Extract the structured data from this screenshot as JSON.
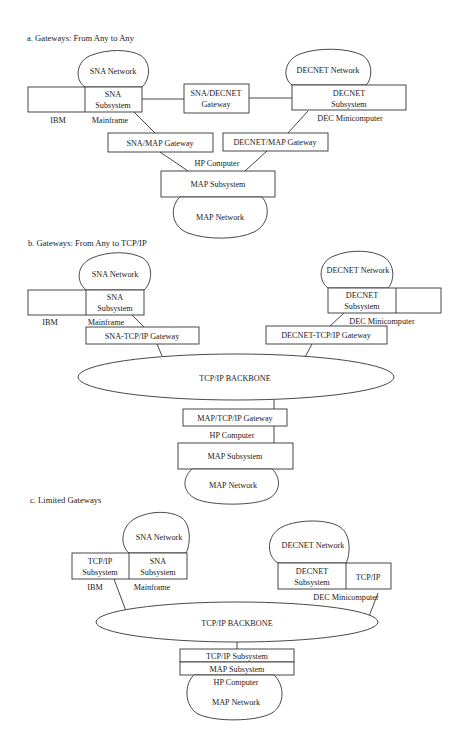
{
  "sections": {
    "a": {
      "title": "a. Gateways: From Any to Any",
      "sna_network": "SNA Network",
      "sna_subsystem_l1": "SNA",
      "sna_subsystem_l2": "Subsystem",
      "ibm": "IBM",
      "mainframe": "Mainframe",
      "sna_decnet_gateway_l1": "SNA/DECNET",
      "sna_decnet_gateway_l2": "Gateway",
      "decnet_network": "DECNET Network",
      "decnet_subsystem_l1": "DECNET",
      "decnet_subsystem_l2": "Subsystem",
      "dec_minicomputer": "DEC Minicomputer",
      "sna_map_gateway": "SNA/MAP Gateway",
      "decnet_map_gateway": "DECNET/MAP Gateway",
      "hp_computer": "HP Computer",
      "map_subsystem": "MAP Subsystem",
      "map_network": "MAP Network"
    },
    "b": {
      "title": "b. Gateways: From Any to TCP/IP",
      "sna_network": "SNA Network",
      "sna_subsystem_l1": "SNA",
      "sna_subsystem_l2": "Subsystem",
      "ibm": "IBM",
      "mainframe": "Mainframe",
      "decnet_network": "DECNET Network",
      "decnet_subsystem_l1": "DECNET",
      "decnet_subsystem_l2": "Subsystem",
      "dec_minicomputer": "DEC Minicomputer",
      "sna_tcpip_gateway": "SNA-TCP/IP Gateway",
      "decnet_tcpip_gateway": "DECNET-TCP/IP Gateway",
      "backbone": "TCP/IP BACKBONE",
      "map_tcpip_gateway": "MAP/TCP/IP Gateway",
      "hp_computer": "HP Computer",
      "map_subsystem": "MAP Subsystem",
      "map_network": "MAP Network"
    },
    "c": {
      "title": "c. Limited Gateways",
      "sna_network": "SNA Network",
      "tcpip_subsystem_l1": "TCP/IP",
      "tcpip_subsystem_l2": "Subsystem",
      "sna_subsystem_l1": "SNA",
      "sna_subsystem_l2": "Subsystem",
      "ibm": "IBM",
      "mainframe": "Mainframe",
      "decnet_network": "DECNET Network",
      "decnet_subsystem_l1": "DECNET",
      "decnet_subsystem_l2": "Subsystem",
      "tcpip": "TCP/IP",
      "dec_minicomputer": "DEC Minicomputer",
      "backbone": "TCP/IP BACKBONE",
      "tcpip_subsystem": "TCP/IP Subsystem",
      "map_subsystem": "MAP Subsystem",
      "hp_computer": "HP Computer",
      "map_network": "MAP Network"
    }
  }
}
